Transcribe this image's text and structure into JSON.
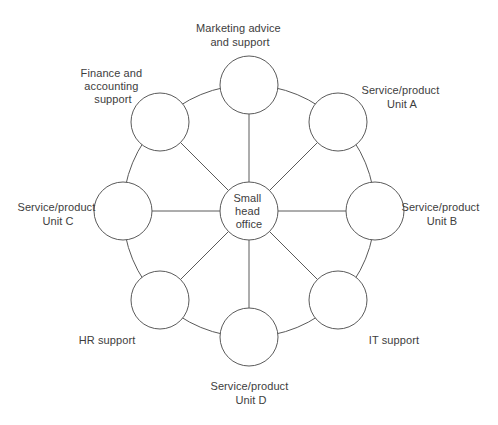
{
  "colors": {
    "stroke": "#5a5a5a",
    "text": "#3d3d3d",
    "background": "#ffffff"
  },
  "diagram": {
    "type": "hub-and-spoke",
    "center": {
      "id": "small-head-office",
      "lines": [
        "Small",
        "head",
        "office"
      ]
    },
    "nodes": [
      {
        "id": "marketing-advice-and-support",
        "position": "top",
        "lines": [
          "Marketing advice",
          "and support"
        ]
      },
      {
        "id": "service-product-unit-a",
        "position": "top-right",
        "lines": [
          "Service/product",
          "Unit A"
        ]
      },
      {
        "id": "service-product-unit-b",
        "position": "right",
        "lines": [
          "Service/product",
          "Unit B"
        ]
      },
      {
        "id": "it-support",
        "position": "bottom-right",
        "lines": [
          "IT support"
        ]
      },
      {
        "id": "service-product-unit-d",
        "position": "bottom",
        "lines": [
          "Service/product",
          "Unit D"
        ]
      },
      {
        "id": "hr-support",
        "position": "bottom-left",
        "lines": [
          "HR support"
        ]
      },
      {
        "id": "service-product-unit-c",
        "position": "left",
        "lines": [
          "Service/product",
          "Unit C"
        ]
      },
      {
        "id": "finance-and-accounting-support",
        "position": "top-left",
        "lines": [
          "Finance and",
          "accounting",
          "support"
        ]
      }
    ]
  }
}
